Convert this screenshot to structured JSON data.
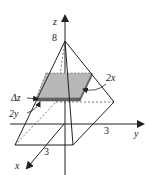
{
  "diagram": {
    "axes": {
      "x": {
        "label": "x",
        "tick": "3"
      },
      "y": {
        "label": "y",
        "tick": "3"
      },
      "z": {
        "label": "z",
        "tick": "8"
      }
    },
    "annotations": {
      "delta_z": "Δz",
      "two_y": "2y",
      "two_x": "2x"
    },
    "colors": {
      "line": "#222222",
      "slab_fill": "#b8b8b8",
      "slab_edge": "#555555"
    }
  }
}
